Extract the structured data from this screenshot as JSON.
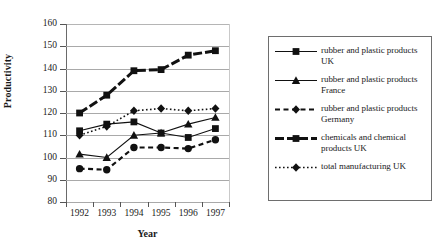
{
  "chart_data": {
    "type": "line",
    "title": "",
    "xlabel": "Year",
    "ylabel": "Productivity",
    "categories": [
      "1992",
      "1993",
      "1994",
      "1995",
      "1996",
      "1997"
    ],
    "ylim": [
      80,
      160
    ],
    "yticks": [
      80,
      90,
      100,
      110,
      120,
      130,
      140,
      150,
      160
    ],
    "grid": true,
    "legend_position": "right",
    "series": [
      {
        "name": "rubber and plastic products UK",
        "marker": "square",
        "line": "solid-thin",
        "values": [
          112,
          115,
          116,
          111,
          109,
          113
        ]
      },
      {
        "name": "rubber and plastic products France",
        "marker": "triangle",
        "line": "solid-thin",
        "values": [
          101.5,
          100,
          110,
          111,
          115,
          118
        ]
      },
      {
        "name": "rubber and plastic products Germany",
        "marker": "circle",
        "line": "dashed",
        "values": [
          95,
          94.5,
          104.5,
          104.5,
          104,
          108
        ]
      },
      {
        "name": "chemicals and chemical products UK",
        "marker": "square",
        "line": "thick-dashed",
        "values": [
          120,
          128,
          139,
          139.5,
          146,
          148
        ]
      },
      {
        "name": "total manufacturing UK",
        "marker": "diamond",
        "line": "dotted",
        "values": [
          110,
          114,
          121,
          122,
          121,
          122
        ]
      }
    ]
  },
  "axes": {
    "y_title": "Productivity",
    "x_title": "Year",
    "y_tick_labels": [
      "160",
      "150",
      "140",
      "130",
      "120",
      "110",
      "100",
      "90",
      "80"
    ],
    "x_tick_labels": [
      "1992",
      "1993",
      "1994",
      "1995",
      "1996",
      "1997"
    ]
  },
  "legend": {
    "entries": [
      {
        "label": "rubber and plastic products UK",
        "line_style": "solid-thin",
        "marker": "square"
      },
      {
        "label": "rubber and plastic products France",
        "line_style": "solid-thin",
        "marker": "triangle"
      },
      {
        "label": "rubber and plastic products Germany",
        "line_style": "dashed",
        "marker": "diamond"
      },
      {
        "label": "chemicals and chemical products UK",
        "line_style": "thick-dashed",
        "marker": "square"
      },
      {
        "label": "total manufacturing UK",
        "line_style": "dotted",
        "marker": "diamond"
      }
    ]
  },
  "colors": {
    "ink": "#111111",
    "grid": "#a9a9a9",
    "axis": "#555555",
    "background": "#ffffff"
  }
}
